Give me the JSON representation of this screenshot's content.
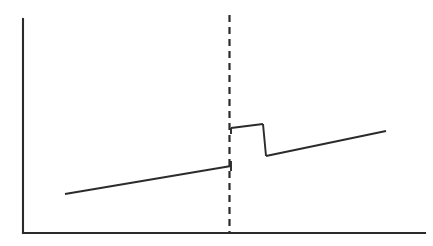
{
  "figure": {
    "title": "",
    "background_color": "#ffffff",
    "ink_color": "#2b2b2b",
    "width": 433,
    "height": 246
  },
  "chart_data": {
    "type": "line",
    "title": "",
    "subtitle": "",
    "xlabel": "",
    "ylabel": "",
    "xlim": [
      0,
      1
    ],
    "ylim": [
      0,
      1
    ],
    "grid": false,
    "legend": null,
    "axes": {
      "y_axis": {
        "x": 23,
        "y_top": 19,
        "y_bottom": 233
      },
      "x_axis": {
        "y": 233,
        "x_left": 23,
        "x_right": 425
      }
    },
    "annotations": [
      {
        "name": "cutoff-threshold",
        "style": "dashed-vertical",
        "x": 229.5,
        "y_top": 15,
        "y_bottom": 233
      }
    ],
    "series": [
      {
        "name": "pre-cutoff-trend",
        "style": "solid",
        "points": [
          [
            65,
            194
          ],
          [
            231,
            166
          ]
        ],
        "endpoint_tick": {
          "x": 231,
          "y_top": 161,
          "y_bottom": 171
        }
      },
      {
        "name": "post-cutoff-plateau",
        "style": "solid",
        "points": [
          [
            231,
            128
          ],
          [
            263,
            124
          ]
        ],
        "endpoint_tick": {
          "x": 231,
          "y_top": 128,
          "y_bottom": 134
        }
      },
      {
        "name": "post-plateau-drop",
        "style": "solid",
        "points": [
          [
            263,
            124
          ],
          [
            266,
            156
          ]
        ]
      },
      {
        "name": "post-cutoff-trend",
        "style": "solid",
        "points": [
          [
            266,
            156
          ],
          [
            386,
            131
          ]
        ]
      }
    ]
  }
}
